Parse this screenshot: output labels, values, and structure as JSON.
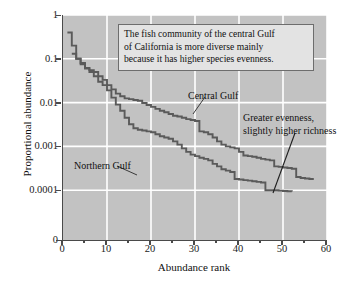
{
  "chart_data": {
    "type": "line",
    "title": "",
    "subtitle": "",
    "xlabel": "Abundance rank",
    "ylabel": "Proportional abundance",
    "xlim": [
      0,
      60
    ],
    "ylim": [
      0.0001,
      1
    ],
    "yscale": "log",
    "grid": true,
    "grid_color": "#ffffff",
    "background_color": "#c2c2c2",
    "legend_position": "inline-annotations",
    "x_ticks": [
      0,
      10,
      20,
      30,
      40,
      50,
      60
    ],
    "x_tick_labels": [
      "0",
      "10",
      "20",
      "30",
      "40",
      "50",
      "60"
    ],
    "x_minor_ticks": [
      5,
      15,
      25,
      35,
      45,
      55
    ],
    "y_ticks": [
      1,
      0.1,
      0.01,
      0.001,
      0.0001,
      0
    ],
    "y_tick_labels": [
      "1",
      "0.1",
      "0.01",
      "0.001",
      "0.0001",
      "0"
    ],
    "series": [
      {
        "name": "Central Gulf",
        "color": "#5a5a5a",
        "x": [
          2,
          3,
          4,
          5,
          6,
          7,
          8,
          9,
          10,
          11,
          12,
          13,
          14,
          15,
          16,
          17,
          18,
          19,
          20,
          21,
          22,
          23,
          24,
          25,
          26,
          27,
          28,
          29,
          30,
          31,
          32,
          33,
          34,
          35,
          36,
          37,
          38,
          39,
          40,
          41,
          42,
          43,
          44,
          45,
          46,
          47,
          48,
          49,
          50,
          51,
          52,
          53,
          54,
          55,
          56,
          57
        ],
        "values": [
          0.13,
          0.1,
          0.08,
          0.062,
          0.055,
          0.05,
          0.04,
          0.033,
          0.025,
          0.02,
          0.016,
          0.014,
          0.0125,
          0.012,
          0.0115,
          0.011,
          0.0098,
          0.0088,
          0.008,
          0.0072,
          0.0065,
          0.006,
          0.0055,
          0.005,
          0.0048,
          0.0045,
          0.0042,
          0.004,
          0.0038,
          0.0022,
          0.0021,
          0.0019,
          0.0016,
          0.0013,
          0.0011,
          0.001,
          0.00095,
          0.0009,
          0.00075,
          0.00062,
          0.0006,
          0.00058,
          0.00055,
          0.00052,
          0.0005,
          0.00048,
          0.00035,
          0.00034,
          0.00033,
          0.00032,
          0.00031,
          0.0002,
          0.00019,
          0.000185,
          0.00018,
          0.00018
        ]
      },
      {
        "name": "Northern Gulf",
        "color": "#5a5a5a",
        "x": [
          1,
          2,
          3,
          4,
          5,
          6,
          7,
          8,
          9,
          10,
          11,
          12,
          13,
          14,
          15,
          16,
          17,
          18,
          19,
          20,
          21,
          22,
          23,
          24,
          25,
          26,
          27,
          28,
          29,
          30,
          31,
          32,
          33,
          34,
          35,
          36,
          37,
          38,
          39,
          40,
          41,
          42,
          43,
          44,
          45,
          46,
          47,
          48,
          49,
          50,
          51,
          52
        ],
        "values": [
          0.4,
          0.2,
          0.1,
          0.075,
          0.06,
          0.05,
          0.04,
          0.03,
          0.025,
          0.019,
          0.013,
          0.009,
          0.0065,
          0.0045,
          0.0032,
          0.0026,
          0.0024,
          0.0023,
          0.0022,
          0.0021,
          0.0019,
          0.0017,
          0.0016,
          0.0015,
          0.0013,
          0.0011,
          0.0009,
          0.00075,
          0.00065,
          0.0006,
          0.00055,
          0.00052,
          0.00048,
          0.0004,
          0.00035,
          0.0003,
          0.00028,
          0.00026,
          0.00018,
          0.000175,
          0.00017,
          0.000165,
          0.00016,
          0.000155,
          0.00015,
          0.0001,
          0.0001,
          0.0001,
          9.8e-05,
          9.6e-05,
          9.5e-05,
          9.4e-05
        ]
      }
    ],
    "annotations": [
      {
        "id": "callout",
        "text": "The fish community of the central Gulf of California is more diverse mainly because it has higher species evenness.",
        "style": "boxed-callout"
      },
      {
        "id": "central-gulf-label",
        "text": "Central Gulf",
        "style": "leader-line"
      },
      {
        "id": "northern-gulf-label",
        "text": "Northern Gulf",
        "style": "leader-line"
      },
      {
        "id": "greater-evenness-label",
        "text": "Greater evenness, slightly higher richness",
        "style": "leader-line"
      }
    ]
  },
  "callout": {
    "line1": "The fish community of the central Gulf",
    "line2": "of California is more diverse mainly",
    "line3": "because it has higher species evenness."
  },
  "labels": {
    "central_gulf": "Central Gulf",
    "northern_gulf": "Northern Gulf",
    "greater_line1": "Greater evenness,",
    "greater_line2": "slightly higher richness",
    "xlabel": "Abundance rank",
    "ylabel": "Proportional abundance"
  }
}
